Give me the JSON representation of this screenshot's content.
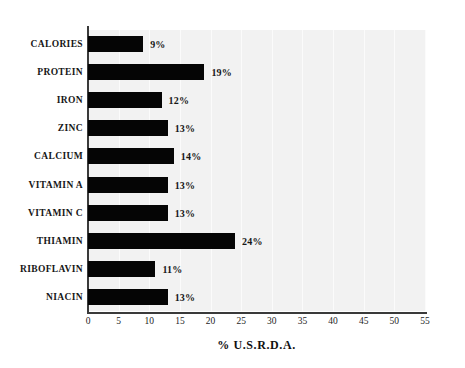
{
  "chart_data": {
    "type": "bar",
    "orientation": "horizontal",
    "title": "",
    "xlabel": "% U.S.R.D.A.",
    "ylabel": "",
    "xlim": [
      0,
      55
    ],
    "xticks": [
      0,
      5,
      10,
      15,
      20,
      25,
      30,
      35,
      40,
      45,
      50,
      55
    ],
    "xtick_labels": [
      "0",
      "5",
      "10",
      "15",
      "20",
      "25",
      "30",
      "35",
      "40",
      "45",
      "50",
      "55"
    ],
    "grid": true,
    "legend": null,
    "categories": [
      "CALORIES",
      "PROTEIN",
      "IRON",
      "ZINC",
      "CALCIUM",
      "VITAMIN A",
      "VITAMIN C",
      "THIAMIN",
      "RIBOFLAVIN",
      "NIACIN"
    ],
    "values": [
      9,
      19,
      12,
      13,
      14,
      13,
      13,
      24,
      11,
      13
    ],
    "value_labels": [
      "9%",
      "19%",
      "12%",
      "13%",
      "14%",
      "13%",
      "13%",
      "24%",
      "11%",
      "13%"
    ],
    "bars": [
      {
        "category": "CALORIES",
        "value": 9,
        "label": "9%"
      },
      {
        "category": "PROTEIN",
        "value": 19,
        "label": "19%"
      },
      {
        "category": "IRON",
        "value": 12,
        "label": "12%"
      },
      {
        "category": "ZINC",
        "value": 13,
        "label": "13%"
      },
      {
        "category": "CALCIUM",
        "value": 14,
        "label": "14%"
      },
      {
        "category": "VITAMIN A",
        "value": 13,
        "label": "13%"
      },
      {
        "category": "VITAMIN C",
        "value": 13,
        "label": "13%"
      },
      {
        "category": "THIAMIN",
        "value": 24,
        "label": "24%"
      },
      {
        "category": "RIBOFLAVIN",
        "value": 11,
        "label": "11%"
      },
      {
        "category": "NIACIN",
        "value": 13,
        "label": "13%"
      }
    ],
    "colors": {
      "bar": "#050505",
      "plot_background": "#f2f2f2",
      "page_background": "#ffffff",
      "axis": "#3a3a3a",
      "gridline": "#fbfbfb",
      "text": "#161616"
    }
  }
}
